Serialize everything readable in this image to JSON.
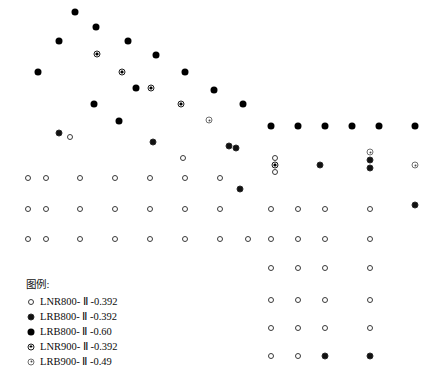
{
  "legend": {
    "title": "图例:",
    "items": [
      {
        "key": "lnr800",
        "label": "LNR800- Ⅱ -0.392",
        "marker": "open-circle"
      },
      {
        "key": "lrb800a",
        "label": "LRB800- Ⅱ -0.392",
        "marker": "filled-circle-haloed"
      },
      {
        "key": "lrb800b",
        "label": "LRB800- Ⅱ -0.60",
        "marker": "filled-circle"
      },
      {
        "key": "lnr900",
        "label": "LNR900- Ⅱ -0.392",
        "marker": "bullseye-circle"
      },
      {
        "key": "lrb900",
        "label": "LRB900- Ⅱ -0.49",
        "marker": "donut-circle"
      }
    ]
  },
  "chart_data": {
    "type": "scatter",
    "title": "",
    "xlabel": "",
    "ylabel": "",
    "grid": false,
    "axes_visible": false,
    "legend_position": "bottom-left",
    "xlim": [
      0,
      444
    ],
    "ylim": [
      0,
      378
    ],
    "colors": {
      "lnr800": "#3a3a3a",
      "lrb800a": "#111111",
      "lrb800b": "#000000",
      "lnr900": "#1d1d1d",
      "lrb900": "#6f6f6f"
    },
    "series": [
      {
        "name": "LRB800- Ⅱ -0.60",
        "key": "lrb800b",
        "marker": "filled-circle",
        "points": [
          [
            75,
            12
          ],
          [
            96,
            27
          ],
          [
            59,
            41
          ],
          [
            128,
            41
          ],
          [
            156,
            55
          ],
          [
            38,
            72
          ],
          [
            185,
            72
          ],
          [
            94,
            104
          ],
          [
            214,
            90
          ],
          [
            243,
            104
          ],
          [
            271,
            126
          ],
          [
            298,
            126
          ],
          [
            325,
            126
          ],
          [
            352,
            126
          ],
          [
            379,
            126
          ],
          [
            415,
            126
          ],
          [
            136,
            88
          ],
          [
            119,
            121
          ]
        ]
      },
      {
        "name": "LRB800- Ⅱ -0.392",
        "key": "lrb800a",
        "marker": "filled-circle-haloed",
        "points": [
          [
            59,
            133
          ],
          [
            153,
            142
          ],
          [
            229,
            146
          ],
          [
            236,
            148
          ],
          [
            320,
            165
          ],
          [
            370,
            160
          ],
          [
            370,
            168
          ],
          [
            240,
            189
          ],
          [
            415,
            205
          ],
          [
            325,
            356
          ],
          [
            370,
            356
          ]
        ]
      },
      {
        "name": "LNR900- Ⅱ -0.392",
        "key": "lnr900",
        "marker": "bullseye-circle",
        "points": [
          [
            97,
            54
          ],
          [
            122,
            72
          ],
          [
            151,
            88
          ],
          [
            181,
            104
          ],
          [
            275,
            165
          ]
        ]
      },
      {
        "name": "LRB900- Ⅱ -0.49",
        "key": "lrb900",
        "marker": "donut-circle",
        "points": [
          [
            209,
            120
          ],
          [
            415,
            165
          ],
          [
            370,
            152
          ]
        ]
      },
      {
        "name": "LNR800- Ⅱ -0.392",
        "key": "lnr800",
        "marker": "open-circle",
        "points": [
          [
            70,
            137
          ],
          [
            183,
            158
          ],
          [
            275,
            158
          ],
          [
            275,
            172
          ],
          [
            28,
            178
          ],
          [
            46,
            178
          ],
          [
            80,
            178
          ],
          [
            115,
            178
          ],
          [
            150,
            178
          ],
          [
            185,
            178
          ],
          [
            220,
            178
          ],
          [
            28,
            209
          ],
          [
            46,
            209
          ],
          [
            80,
            209
          ],
          [
            115,
            209
          ],
          [
            150,
            209
          ],
          [
            185,
            209
          ],
          [
            220,
            209
          ],
          [
            271,
            209
          ],
          [
            298,
            209
          ],
          [
            325,
            209
          ],
          [
            370,
            209
          ],
          [
            28,
            239
          ],
          [
            46,
            239
          ],
          [
            80,
            239
          ],
          [
            115,
            239
          ],
          [
            150,
            239
          ],
          [
            185,
            239
          ],
          [
            220,
            239
          ],
          [
            248,
            239
          ],
          [
            271,
            239
          ],
          [
            298,
            239
          ],
          [
            325,
            239
          ],
          [
            370,
            239
          ],
          [
            271,
            268
          ],
          [
            298,
            268
          ],
          [
            325,
            268
          ],
          [
            370,
            268
          ],
          [
            271,
            300
          ],
          [
            298,
            300
          ],
          [
            325,
            300
          ],
          [
            370,
            300
          ],
          [
            271,
            328
          ],
          [
            298,
            328
          ],
          [
            325,
            328
          ],
          [
            370,
            328
          ],
          [
            271,
            356
          ],
          [
            298,
            356
          ]
        ]
      }
    ]
  }
}
